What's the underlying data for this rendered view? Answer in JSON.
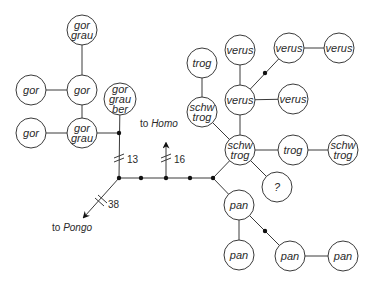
{
  "diagram": {
    "type": "haplotype-network",
    "nodes": [
      {
        "id": "n1",
        "lines": [
          "gor",
          "grau"
        ],
        "x": 82,
        "y": 30
      },
      {
        "id": "n2",
        "lines": [
          "gor"
        ],
        "x": 31,
        "y": 90
      },
      {
        "id": "n3",
        "lines": [
          "gor"
        ],
        "x": 82,
        "y": 90
      },
      {
        "id": "n4",
        "lines": [
          "gor"
        ],
        "x": 31,
        "y": 133
      },
      {
        "id": "n5",
        "lines": [
          "gor",
          "grau"
        ],
        "x": 82,
        "y": 133
      },
      {
        "id": "n6",
        "lines": [
          "gor",
          "grau",
          "ber"
        ],
        "x": 120,
        "y": 99
      },
      {
        "id": "n7",
        "lines": [
          "trog"
        ],
        "x": 202,
        "y": 63
      },
      {
        "id": "n8",
        "lines": [
          "schw",
          "trog"
        ],
        "x": 202,
        "y": 112
      },
      {
        "id": "n9",
        "lines": [
          "verus"
        ],
        "x": 240,
        "y": 50
      },
      {
        "id": "n10",
        "lines": [
          "verus"
        ],
        "x": 240,
        "y": 100
      },
      {
        "id": "n11",
        "lines": [
          "verus"
        ],
        "x": 289,
        "y": 48
      },
      {
        "id": "n12",
        "lines": [
          "verus"
        ],
        "x": 339,
        "y": 48
      },
      {
        "id": "n13",
        "lines": [
          "verus"
        ],
        "x": 293,
        "y": 99
      },
      {
        "id": "n14",
        "lines": [
          "schw",
          "trog"
        ],
        "x": 240,
        "y": 150
      },
      {
        "id": "n15",
        "lines": [
          "trog"
        ],
        "x": 293,
        "y": 150
      },
      {
        "id": "n16",
        "lines": [
          "schw",
          "trog"
        ],
        "x": 343,
        "y": 150
      },
      {
        "id": "n17",
        "lines": [
          "?"
        ],
        "x": 277,
        "y": 187
      },
      {
        "id": "n18",
        "lines": [
          "pan"
        ],
        "x": 239,
        "y": 205
      },
      {
        "id": "n19",
        "lines": [
          "pan"
        ],
        "x": 239,
        "y": 255
      },
      {
        "id": "n20",
        "lines": [
          "pan"
        ],
        "x": 290,
        "y": 256
      },
      {
        "id": "n21",
        "lines": [
          "pan"
        ],
        "x": 343,
        "y": 256
      }
    ],
    "branch_labels": {
      "homo_prefix": "to ",
      "homo_name": "Homo",
      "homo_count": "16",
      "pongo_prefix": "to ",
      "pongo_name": "Pongo",
      "pongo_count": "38",
      "gorilla_count": "13"
    },
    "colors": {
      "line": "#3a3a3a",
      "dot": "#111111",
      "background": "#ffffff"
    }
  }
}
